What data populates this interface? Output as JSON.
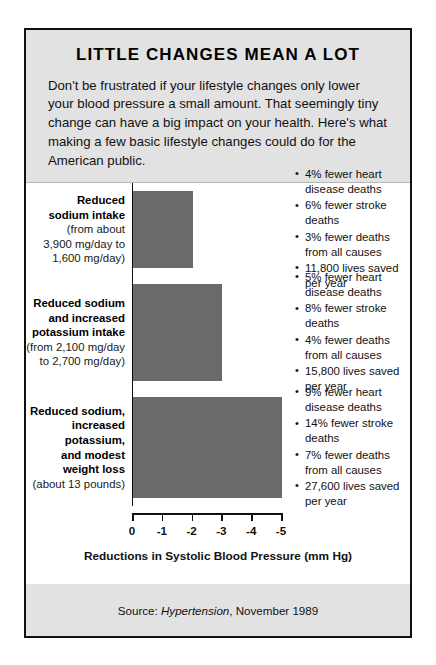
{
  "poster": {
    "title": "LITTLE CHANGES MEAN A LOT",
    "intro": "Don't be frustrated if your lifestyle changes only lower your blood pressure a small amount. That seemingly tiny change can have a big impact on your health. Here's what making a few basic lifestyle changes could do for the American public.",
    "source_prefix": "Source: ",
    "source_journal": "Hypertension",
    "source_suffix": ", November 1989",
    "bar_color": "#6a6a6a",
    "panel_bg": "#e2e2e2",
    "plot_bg": "#ffffff",
    "border_color": "#111111"
  },
  "chart_data": {
    "type": "bar",
    "orientation": "horizontal",
    "title": "LITTLE CHANGES MEAN A LOT",
    "xlabel": "Reductions in Systolic Blood Pressure (mm Hg)",
    "ylabel": "",
    "xlim": [
      0,
      -5
    ],
    "xticks": [
      0,
      -1,
      -2,
      -3,
      -4,
      -5
    ],
    "xtick_labels": [
      "0",
      "-1",
      "-2",
      "-3",
      "-4",
      "-5"
    ],
    "grid": false,
    "legend": false,
    "categories": [
      "Reduced sodium intake",
      "Reduced sodium and increased potassium intake",
      "Reduced sodium, increased potassium, and modest weight loss"
    ],
    "values": [
      -2,
      -3,
      -5
    ],
    "rows": [
      {
        "label_main": "Reduced\nsodium intake",
        "label_sub": "(from about\n3,900 mg/day to\n1,600 mg/day)",
        "value": -2,
        "bullets": [
          "4% fewer heart disease deaths",
          "6% fewer stroke deaths",
          "3% fewer deaths from all causes",
          "11,800 lives saved per year"
        ]
      },
      {
        "label_main": "Reduced sodium\nand increased\npotassium intake",
        "label_sub": "(from 2,100 mg/day\nto 2,700 mg/day)",
        "value": -3,
        "bullets": [
          "5% fewer heart disease deaths",
          "8% fewer stroke deaths",
          "4% fewer deaths from all causes",
          "15,800 lives saved per year"
        ]
      },
      {
        "label_main": "Reduced sodium,\nincreased\npotassium,\nand modest\nweight loss",
        "label_sub": "(about 13 pounds)",
        "value": -5,
        "bullets": [
          "9% fewer heart disease deaths",
          "14% fewer stroke deaths",
          "7% fewer deaths from all causes",
          "27,600 lives saved per year"
        ]
      }
    ]
  }
}
